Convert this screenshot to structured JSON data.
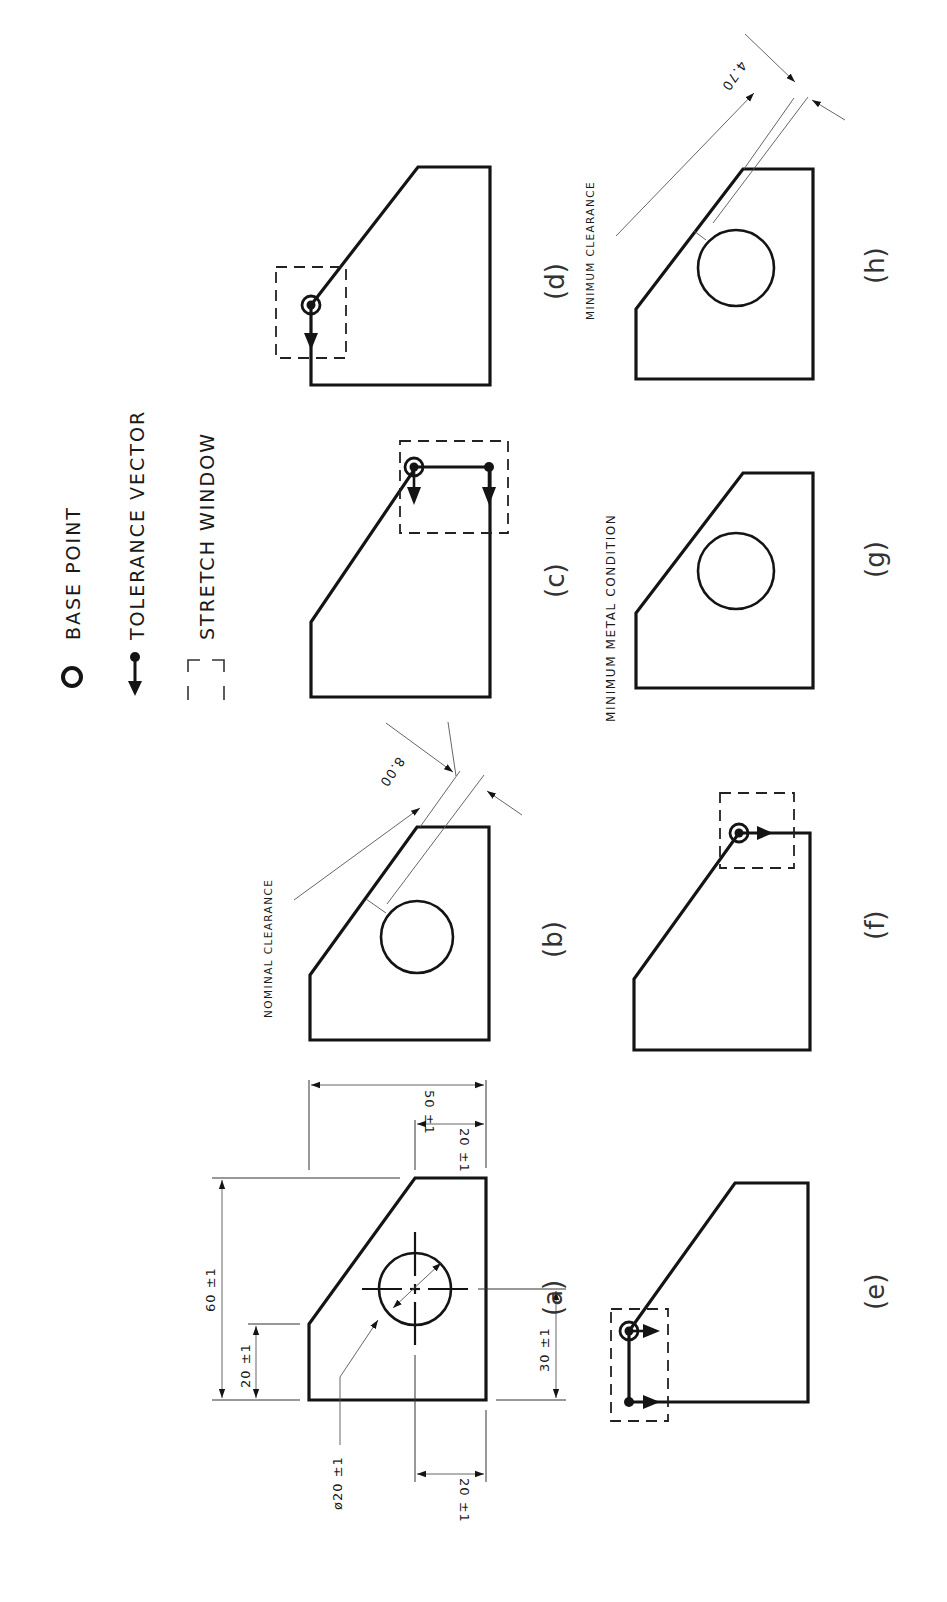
{
  "legend": {
    "items": [
      {
        "icon": "base-point-icon",
        "label": "BASE POINT"
      },
      {
        "icon": "tolerance-vector-icon",
        "label": "TOLERANCE VECTOR"
      },
      {
        "icon": "stretch-window-icon",
        "label": "STRETCH WINDOW"
      }
    ]
  },
  "parts": {
    "a": {
      "label": "(a)"
    },
    "b": {
      "label": "(b)",
      "note": "NOMINAL CLEARANCE",
      "dimension": "8.00"
    },
    "c": {
      "label": "(c)"
    },
    "d": {
      "label": "(d)"
    },
    "e": {
      "label": "(e)"
    },
    "f": {
      "label": "(f)"
    },
    "g": {
      "label": "(g)",
      "note": "MINIMUM METAL CONDITION"
    },
    "h": {
      "label": "(h)",
      "note": "MINIMUM CLEARANCE",
      "dimension": "4.70"
    }
  },
  "dimensions": {
    "overall_height": "60 ±1",
    "chamfer_height": "20 ±1",
    "hole_diameter": "ø20 ±1",
    "hole_from_left": "20 ±1",
    "hole_from_bottom": "30 ±1",
    "overall_width": "50 ±1",
    "chamfer_width": "20 ±1"
  },
  "colors": {
    "ink": "#141414",
    "paper": "#ffffff"
  }
}
